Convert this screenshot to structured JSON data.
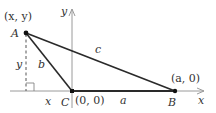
{
  "diagram": {
    "type": "triangle-on-coordinate-axes",
    "colors": {
      "axis": "#9a9a9a",
      "side": "#2a2a2a",
      "point": "#111111",
      "text": "#333333",
      "background": "#ffffff"
    },
    "points": {
      "A": {
        "label": "A",
        "coord_label": "(x, y)",
        "px": [
          26,
          33
        ]
      },
      "B": {
        "label": "B",
        "coord_label": "(a, 0)",
        "px": [
          175,
          91
        ]
      },
      "C": {
        "label": "C",
        "coord_label": "(0, 0)",
        "px": [
          72,
          91
        ]
      }
    },
    "sides": {
      "a": {
        "label": "a",
        "from": "C",
        "to": "B"
      },
      "b": {
        "label": "b",
        "from": "A",
        "to": "C"
      },
      "c": {
        "label": "c",
        "from": "A",
        "to": "B"
      }
    },
    "axes": {
      "x_label": "x",
      "y_label": "y"
    },
    "auxiliary": {
      "vertical_dashed_label": "y",
      "horizontal_segment_label": "x",
      "right_angle_marker": true
    }
  }
}
